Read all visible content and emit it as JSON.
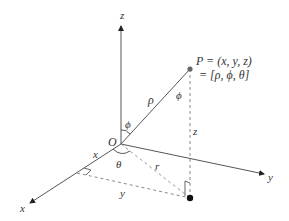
{
  "diagram": {
    "labels": {
      "z_axis": "z",
      "y_axis": "y",
      "x_axis": "x",
      "origin": "O",
      "rho": "ρ",
      "phi_at_origin": "ϕ",
      "phi_at_point": "ϕ",
      "theta": "θ",
      "r": "r",
      "z_height": "z",
      "x_coord": "x",
      "y_coord": "y"
    },
    "point": {
      "line1": "P = (x, y, z)",
      "line2": "= [ρ, ϕ, θ]"
    },
    "colors": {
      "line": "#555555",
      "dashed": "#888888",
      "text": "#333333",
      "point_p": "#666666",
      "foot_point": "#111111"
    }
  }
}
